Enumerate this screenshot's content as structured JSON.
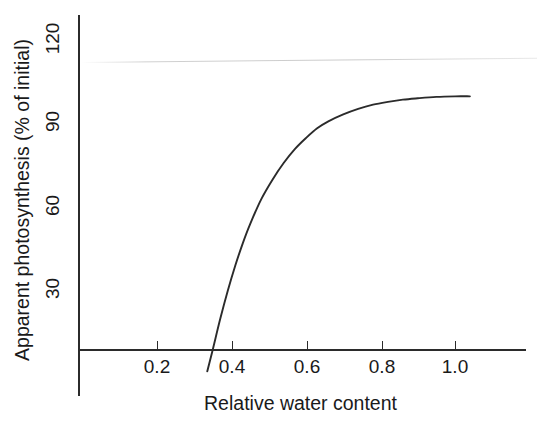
{
  "figure": {
    "background_color": "#ffffff",
    "ink_color": "#2b2b2b"
  },
  "chart_data": {
    "type": "line",
    "title": "",
    "xlabel": "Relative water content",
    "ylabel": "Apparent photosynthesis (% of initial)",
    "xlim": [
      0.08,
      1.2
    ],
    "ylim": [
      0,
      131
    ],
    "xticks": [
      0.2,
      0.4,
      0.6,
      0.8,
      1.0
    ],
    "xtick_labels": [
      "0.2",
      "0.4",
      "0.6",
      "0.8",
      "1.0"
    ],
    "yticks": [
      30,
      60,
      90,
      120
    ],
    "ytick_labels": [
      "30",
      "60",
      "90",
      "120"
    ],
    "grid": false,
    "legend": null,
    "series": [
      {
        "name": "Apparent photosynthesis",
        "x": [
          0.335,
          0.35,
          0.37,
          0.39,
          0.41,
          0.43,
          0.45,
          0.48,
          0.51,
          0.54,
          0.57,
          0.6,
          0.63,
          0.66,
          0.7,
          0.74,
          0.78,
          0.82,
          0.86,
          0.9,
          0.95,
          1.0,
          1.04
        ],
        "y": [
          0,
          8,
          19,
          29,
          38,
          46,
          53,
          62,
          69,
          75,
          80,
          84,
          87.5,
          90,
          92.5,
          94.5,
          96,
          97,
          97.8,
          98.3,
          98.8,
          99,
          99
        ]
      }
    ],
    "annotations": [
      {
        "name": "scan-artifact-line",
        "description": "faint light-grey horizontal scanning streak near the top of the plot",
        "approx_y_value": 112
      }
    ]
  },
  "axes": {
    "y_tick_labels": [
      {
        "text": "120",
        "value": 120,
        "px_top": 38
      },
      {
        "text": "90",
        "value": 90,
        "px_top": 121
      },
      {
        "text": "60",
        "value": 60,
        "px_top": 205
      },
      {
        "text": "30",
        "value": 30,
        "px_top": 288
      }
    ],
    "x_tick_labels": [
      {
        "text": "0.2",
        "value": 0.2,
        "px_left": 157
      },
      {
        "text": "0.4",
        "value": 0.4,
        "px_left": 232
      },
      {
        "text": "0.6",
        "value": 0.6,
        "px_left": 307
      },
      {
        "text": "0.8",
        "value": 0.8,
        "px_left": 382
      },
      {
        "text": "1.0",
        "value": 1.0,
        "px_left": 455
      }
    ]
  }
}
